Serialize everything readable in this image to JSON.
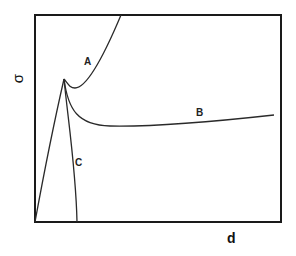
{
  "diagram": {
    "axes": {
      "x_label": "d",
      "y_label": "σ"
    },
    "curves": [
      {
        "id": "A",
        "label": "A",
        "description": "rises from origin to peak, dips to local minimum, then rises steeply"
      },
      {
        "id": "B",
        "label": "B",
        "description": "rises from origin to peak, decays to a plateau that slowly increases"
      },
      {
        "id": "C",
        "label": "C",
        "description": "rises from origin to peak, then drops back to zero"
      }
    ],
    "colors": {
      "line": "#2a2a2a",
      "background": "#ffffff"
    }
  }
}
